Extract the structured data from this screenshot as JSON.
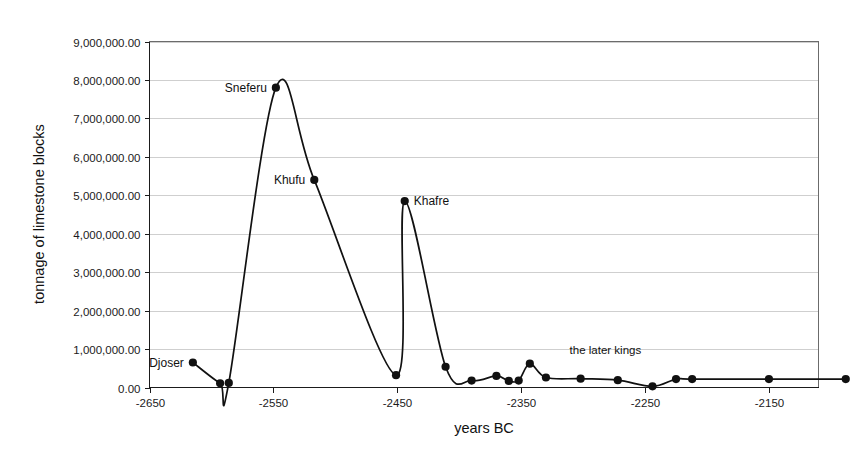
{
  "chart_data": {
    "type": "line",
    "title": "",
    "xlabel": "years BC",
    "ylabel": "tonnage of limestone blocks",
    "xlim": [
      -2650,
      -2110
    ],
    "ylim": [
      0,
      9000000
    ],
    "grid": true,
    "legend": false,
    "x_ticks": [
      -2650,
      -2550,
      -2450,
      -2350,
      -2250,
      -2150
    ],
    "x_tick_labels": [
      "-2650",
      "-2550",
      "-2450",
      "-2350",
      "-2250",
      "-2150"
    ],
    "y_ticks": [
      0,
      1000000,
      2000000,
      3000000,
      4000000,
      5000000,
      6000000,
      7000000,
      8000000,
      9000000
    ],
    "y_tick_labels": [
      "0.00",
      "1,000,000.00",
      "2,000,000.00",
      "3,000,000.00",
      "4,000,000.00",
      "5,000,000.00",
      "6,000,000.00",
      "7,000,000.00",
      "8,000,000.00",
      "9,000,000.00"
    ],
    "series": [
      {
        "name": "tonnage of limestone blocks",
        "color": "#111111",
        "x": [
          -2615,
          -2593,
          -2586,
          -2548,
          -2517,
          -2451,
          -2444,
          -2411,
          -2390,
          -2370,
          -2360,
          -2352,
          -2343,
          -2330,
          -2302,
          -2272,
          -2244,
          -2225,
          -2212,
          -2150,
          -2088
        ],
        "values": [
          650000,
          110000,
          120000,
          7800000,
          5400000,
          320000,
          4850000,
          540000,
          180000,
          300000,
          170000,
          180000,
          620000,
          260000,
          230000,
          190000,
          30000,
          220000,
          220000,
          220000,
          220000
        ]
      }
    ],
    "point_labels": [
      {
        "text": "Djoser",
        "x": -2615,
        "y": 650000,
        "anchor": "end",
        "dx": -9,
        "dy": 4
      },
      {
        "text": "Sneferu",
        "x": -2548,
        "y": 7800000,
        "anchor": "end",
        "dx": -9,
        "dy": 4
      },
      {
        "text": "Khufu",
        "x": -2517,
        "y": 5400000,
        "anchor": "end",
        "dx": -9,
        "dy": 4
      },
      {
        "text": "Khafre",
        "x": -2444,
        "y": 4850000,
        "anchor": "start",
        "dx": 9,
        "dy": 4
      }
    ],
    "annotations": [
      {
        "text": "the later kings",
        "x": -2282,
        "y": 880000,
        "anchor": "middle"
      }
    ]
  }
}
